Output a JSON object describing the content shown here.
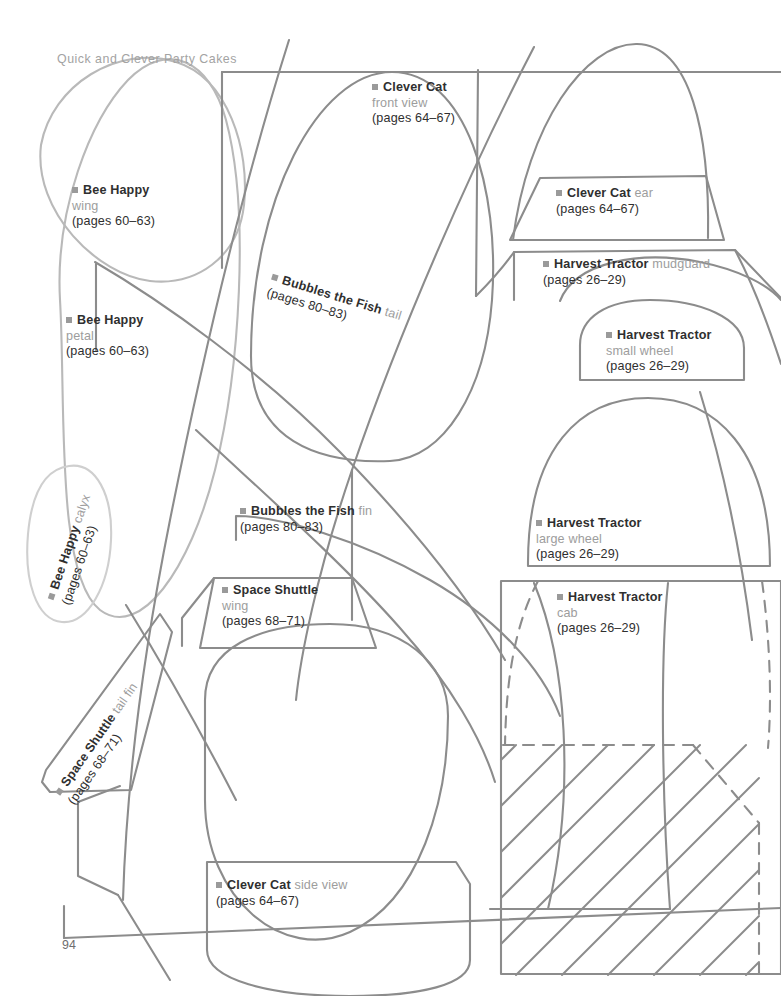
{
  "page": {
    "book_title": "Quick and Clever Party Cakes",
    "folio": "94",
    "background_color": "#ffffff",
    "line_color": "#8c8c8c",
    "line_color_light": "#c9c9c9",
    "bullet_color": "#9a9a9a",
    "text_color": "#2f2f2f",
    "text_color_soft": "#9d9d9d"
  },
  "labels": [
    {
      "id": "clever-cat-front-view",
      "title": "Clever Cat",
      "part": "front view",
      "pages": "(pages 64–67)",
      "layout": "stacked"
    },
    {
      "id": "bee-happy-wing",
      "title": "Bee Happy",
      "part": "wing",
      "pages": "(pages 60–63)",
      "layout": "stacked"
    },
    {
      "id": "bee-happy-petal",
      "title": "Bee Happy",
      "part": "petal",
      "pages": "(pages 60–63)",
      "layout": "stacked"
    },
    {
      "id": "clever-cat-ear",
      "title": "Clever Cat",
      "part": "ear",
      "pages": "(pages 64–67)",
      "layout": "inline"
    },
    {
      "id": "harvest-tractor-mudguard",
      "title": "Harvest Tractor",
      "part": "mudguard",
      "pages": "(pages 26–29)",
      "layout": "inline"
    },
    {
      "id": "harvest-tractor-small-wheel",
      "title": "Harvest Tractor",
      "part": "small wheel",
      "pages": "(pages 26–29)",
      "layout": "stacked"
    },
    {
      "id": "bubbles-the-fish-tail",
      "title": "Bubbles the Fish",
      "part": "tail",
      "pages": "(pages 80–83)",
      "layout": "inline-rotated"
    },
    {
      "id": "bubbles-the-fish-fin",
      "title": "Bubbles the Fish",
      "part": "fin",
      "pages": "(pages 80–83)",
      "layout": "inline"
    },
    {
      "id": "harvest-tractor-large-wheel",
      "title": "Harvest Tractor",
      "part": "large wheel",
      "pages": "(pages 26–29)",
      "layout": "stacked"
    },
    {
      "id": "space-shuttle-wing",
      "title": "Space Shuttle",
      "part": "wing",
      "pages": "(pages 68–71)",
      "layout": "stacked"
    },
    {
      "id": "harvest-tractor-cab",
      "title": "Harvest Tractor",
      "part": "cab",
      "pages": "(pages 26–29)",
      "layout": "stacked"
    },
    {
      "id": "bee-happy-calyx",
      "title": "Bee Happy",
      "part": "calyx",
      "pages": "(pages 60–63)",
      "layout": "inline-rotated"
    },
    {
      "id": "space-shuttle-tail-fin",
      "title": "Space Shuttle",
      "part": "tail fin",
      "pages": "(pages 68–71)",
      "layout": "inline-rotated"
    },
    {
      "id": "clever-cat-side-view",
      "title": "Clever Cat",
      "part": "side view",
      "pages": "(pages 64–67)",
      "layout": "inline"
    }
  ]
}
